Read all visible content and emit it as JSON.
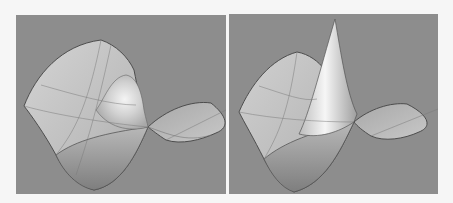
{
  "figure": {
    "panels": [
      {
        "id": "left",
        "description": "Saddle-like surface with a smooth rounded bump",
        "background": "#8d8d8d",
        "surface_fill_light": "#d8d8d8",
        "surface_fill_dark": "#9a9a9a",
        "edge_color": "#4a4a4a"
      },
      {
        "id": "right",
        "description": "Saddle-like surface with a sharp spike",
        "background": "#8d8d8d",
        "surface_fill_light": "#e2e2e2",
        "surface_fill_dark": "#9a9a9a",
        "edge_color": "#4a4a4a"
      }
    ]
  }
}
